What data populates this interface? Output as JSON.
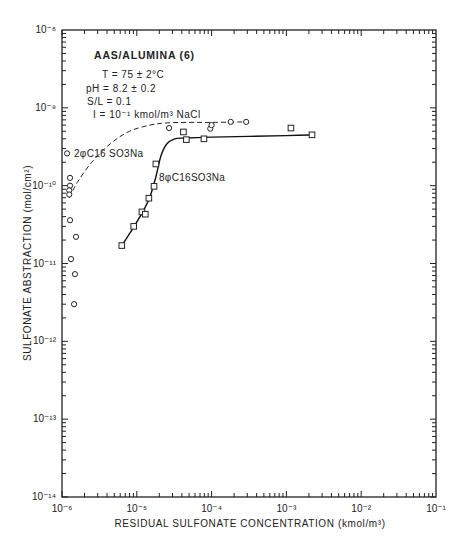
{
  "chart_data": {
    "type": "scatter",
    "title": "AAS/ALUMINA (6)",
    "conditions": [
      "T = 75 ± 2°C",
      "pH = 8.2 ± 0.2",
      "S/L = 0.1",
      "I = 10⁻¹ kmol/m³ NaCl"
    ],
    "xlabel": "RESIDUAL SULFONATE CONCENTRATION (kmol/m³)",
    "ylabel": "SULFONATE ABSTRACTION (mol/cm²)",
    "xscale": "log",
    "yscale": "log",
    "xlim": [
      1e-06,
      0.1
    ],
    "ylim": [
      1e-14,
      1e-08
    ],
    "x_tick_labels": [
      "10⁻⁶",
      "10⁻⁵",
      "10⁻⁴",
      "10⁻³",
      "10⁻²",
      "10⁻¹"
    ],
    "y_tick_labels": [
      "10⁻⁸",
      "10⁻⁹",
      "10⁻¹⁰",
      "10⁻¹¹",
      "10⁻¹²",
      "10⁻¹³",
      "10⁻¹⁴"
    ],
    "grid": false,
    "legend": "inline labels next to curves",
    "series": [
      {
        "name": "2φC16SO3Na",
        "marker": "circle",
        "line": "dashed",
        "points": [
          [
            1.17e-06,
            2.6e-10
          ],
          [
            1.28e-06,
            1.26e-10
          ],
          [
            1.28e-06,
            1e-10
          ],
          [
            1.25e-06,
            8.7e-11
          ],
          [
            1.25e-06,
            7.7e-11
          ],
          [
            1.28e-06,
            3.6e-11
          ],
          [
            1.54e-06,
            2.2e-11
          ],
          [
            1.32e-06,
            1.14e-11
          ],
          [
            1.49e-06,
            7.3e-12
          ],
          [
            1.45e-06,
            3e-12
          ],
          [
            2.7e-05,
            5.5e-10
          ],
          [
            9.6e-05,
            5.4e-10
          ],
          [
            0.0001,
            6e-10
          ],
          [
            0.00018,
            6.6e-10
          ],
          [
            0.00029,
            6.6e-10
          ]
        ],
        "curve": [
          [
            1.25e-06,
            7e-11
          ],
          [
            1.6e-06,
            1.1e-10
          ],
          [
            2.5e-06,
            2e-10
          ],
          [
            4.5e-06,
            3.5e-10
          ],
          [
            8e-06,
            5e-10
          ],
          [
            1.5e-05,
            6e-10
          ],
          [
            2.5e-05,
            6.4e-10
          ],
          [
            5e-05,
            6.5e-10
          ],
          [
            0.0001,
            6.5e-10
          ],
          [
            0.00029,
            6.6e-10
          ]
        ]
      },
      {
        "name": "8φC16SO3Na",
        "marker": "square",
        "line": "solid",
        "points": [
          [
            6.3e-06,
            1.7e-11
          ],
          [
            9.1e-06,
            3e-11
          ],
          [
            1.17e-05,
            4.6e-11
          ],
          [
            1.3e-05,
            4.3e-11
          ],
          [
            1.45e-05,
            6.9e-11
          ],
          [
            1.7e-05,
            9.8e-11
          ],
          [
            1.8e-05,
            1.9e-10
          ],
          [
            4.2e-05,
            4.9e-10
          ],
          [
            4.6e-05,
            3.9e-10
          ],
          [
            7.9e-05,
            4e-10
          ],
          [
            0.00115,
            5.5e-10
          ],
          [
            0.0022,
            4.5e-10
          ]
        ],
        "curve": [
          [
            6.3e-06,
            1.7e-11
          ],
          [
            9e-06,
            2.9e-11
          ],
          [
            1.2e-05,
            4.6e-11
          ],
          [
            1.5e-05,
            7.2e-11
          ],
          [
            1.8e-05,
            1.3e-10
          ],
          [
            2.1e-05,
            2.4e-10
          ],
          [
            2.5e-05,
            3.4e-10
          ],
          [
            3.2e-05,
            4e-10
          ],
          [
            4.5e-05,
            4.1e-10
          ],
          [
            0.0001,
            4.2e-10
          ],
          [
            0.001,
            4.4e-10
          ],
          [
            0.0022,
            4.5e-10
          ]
        ]
      }
    ]
  },
  "labels": {
    "series_2": "2φC16 SO3Na",
    "series_8": "8φC16SO3Na"
  }
}
